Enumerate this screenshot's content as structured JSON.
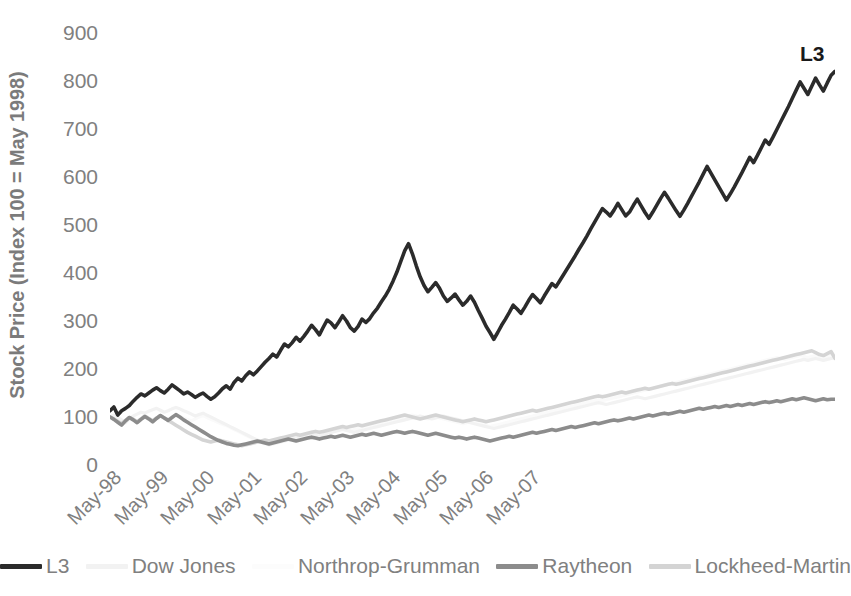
{
  "chart_data": {
    "type": "line",
    "title": "",
    "xlabel": "",
    "ylabel": "Stock Price (Index 100 = May 1998)",
    "ylim": [
      0,
      900
    ],
    "yticks": [
      900,
      800,
      700,
      600,
      500,
      400,
      300,
      200,
      100,
      0
    ],
    "grid": false,
    "legend_position": "bottom",
    "annotations": [
      {
        "text": "L3",
        "series": "L3",
        "position": "end-of-line-top-right"
      }
    ],
    "x_tick_labels": [
      "May-98",
      "May-99",
      "May-00",
      "May-01",
      "May-02",
      "May-03",
      "May-04",
      "May-05",
      "May-06",
      "May-07"
    ],
    "x_start": "May-98",
    "x_end": "Dec-07",
    "x_frequency": "monthly",
    "series": [
      {
        "name": "L3",
        "color": "#2b2b2b",
        "width": 3.6,
        "values": [
          113,
          121,
          104,
          113,
          118,
          124,
          133,
          141,
          148,
          144,
          150,
          156,
          161,
          155,
          150,
          158,
          167,
          161,
          155,
          148,
          152,
          147,
          141,
          146,
          150,
          143,
          137,
          142,
          150,
          159,
          165,
          158,
          172,
          181,
          175,
          186,
          194,
          188,
          196,
          205,
          214,
          222,
          231,
          225,
          239,
          252,
          246,
          255,
          266,
          258,
          268,
          279,
          291,
          282,
          271,
          287,
          302,
          296,
          286,
          298,
          311,
          300,
          286,
          279,
          289,
          304,
          297,
          305,
          317,
          327,
          340,
          352,
          366,
          383,
          402,
          424,
          446,
          461,
          440,
          415,
          392,
          374,
          361,
          370,
          380,
          368,
          352,
          341,
          348,
          356,
          344,
          333,
          341,
          352,
          339,
          322,
          306,
          289,
          276,
          262,
          276,
          291,
          304,
          318,
          333,
          325,
          316,
          329,
          343,
          355,
          347,
          338,
          352,
          365,
          378,
          371,
          384,
          397,
          410,
          423,
          436,
          450,
          463,
          477,
          492,
          506,
          520,
          534,
          527,
          519,
          531,
          545,
          532,
          519,
          527,
          541,
          554,
          540,
          526,
          514,
          527,
          541,
          555,
          568,
          556,
          543,
          530,
          518,
          531,
          545,
          560,
          575,
          590,
          606,
          622,
          608,
          594,
          580,
          566,
          552,
          565,
          579,
          594,
          609,
          625,
          641,
          630,
          645,
          661,
          677,
          668,
          683,
          699,
          715,
          731,
          747,
          764,
          781,
          798,
          785,
          772,
          789,
          806,
          792,
          779,
          796,
          812,
          820
        ]
      },
      {
        "name": "Dow Jones",
        "color": "#f2f2f2",
        "width": 3.2,
        "values": [
          100,
          104,
          99,
          94,
          88,
          96,
          102,
          106,
          110,
          108,
          112,
          115,
          118,
          114,
          110,
          113,
          117,
          120,
          117,
          113,
          110,
          106,
          102,
          105,
          108,
          104,
          100,
          96,
          92,
          88,
          84,
          80,
          76,
          72,
          68,
          64,
          60,
          56,
          52,
          48,
          45,
          42,
          44,
          46,
          48,
          50,
          52,
          54,
          56,
          58,
          60,
          62,
          64,
          62,
          60,
          63,
          66,
          68,
          70,
          72,
          74,
          72,
          70,
          68,
          70,
          72,
          74,
          76,
          78,
          80,
          82,
          84,
          86,
          88,
          90,
          92,
          94,
          96,
          98,
          100,
          102,
          100,
          98,
          96,
          98,
          100,
          102,
          100,
          98,
          96,
          94,
          92,
          90,
          88,
          86,
          84,
          82,
          80,
          78,
          76,
          78,
          80,
          82,
          84,
          86,
          88,
          90,
          92,
          94,
          96,
          98,
          100,
          102,
          104,
          106,
          108,
          110,
          112,
          114,
          116,
          118,
          120,
          122,
          124,
          126,
          128,
          130,
          128,
          126,
          128,
          130,
          132,
          134,
          136,
          138,
          140,
          142,
          140,
          138,
          140,
          142,
          144,
          146,
          148,
          150,
          152,
          154,
          156,
          158,
          160,
          162,
          164,
          166,
          168,
          170,
          172,
          174,
          176,
          178,
          180,
          182,
          184,
          186,
          188,
          190,
          192,
          194,
          196,
          198,
          200,
          202,
          204,
          206,
          208,
          210,
          212,
          214,
          216,
          218,
          220,
          218,
          220,
          222,
          220,
          218,
          220,
          222,
          224
        ]
      },
      {
        "name": "Northrop-Grumman",
        "color": "#fafafa",
        "width": 3.2,
        "values": [
          100,
          97,
          93,
          90,
          94,
          98,
          95,
          92,
          96,
          100,
          97,
          94,
          98,
          102,
          99,
          96,
          100,
          104,
          101,
          98,
          95,
          92,
          96,
          100,
          103,
          99,
          95,
          92,
          88,
          85,
          82,
          78,
          74,
          70,
          66,
          62,
          58,
          54,
          50,
          46,
          44,
          42,
          44,
          46,
          48,
          50,
          52,
          54,
          56,
          58,
          60,
          58,
          60,
          62,
          64,
          66,
          68,
          70,
          72,
          74,
          76,
          74,
          72,
          74,
          76,
          78,
          80,
          82,
          84,
          86,
          88,
          90,
          92,
          94,
          96,
          98,
          100,
          102,
          104,
          102,
          100,
          98,
          96,
          98,
          100,
          98,
          96,
          94,
          92,
          90,
          88,
          86,
          88,
          90,
          88,
          86,
          84,
          82,
          80,
          82,
          84,
          86,
          88,
          90,
          92,
          94,
          96,
          98,
          100,
          102,
          104,
          106,
          108,
          110,
          112,
          114,
          116,
          118,
          120,
          122,
          124,
          126,
          128,
          130,
          132,
          134,
          136,
          134,
          136,
          138,
          140,
          142,
          144,
          146,
          148,
          150,
          152,
          154,
          156,
          158,
          160,
          162,
          164,
          166,
          168,
          170,
          172,
          174,
          176,
          178,
          180,
          182,
          184,
          186,
          188,
          190,
          192,
          194,
          196,
          198,
          200,
          202,
          204,
          206,
          208,
          210,
          212,
          214,
          216,
          218,
          220,
          222,
          224,
          222,
          220,
          222,
          224,
          226,
          228,
          226,
          224,
          226,
          228,
          226,
          224,
          226,
          228,
          226
        ]
      },
      {
        "name": "Raytheon",
        "color": "#8c8c8c",
        "width": 3.6,
        "values": [
          100,
          95,
          89,
          83,
          92,
          99,
          94,
          88,
          95,
          101,
          96,
          90,
          97,
          103,
          98,
          93,
          99,
          105,
          100,
          94,
          89,
          84,
          79,
          74,
          69,
          64,
          59,
          55,
          51,
          48,
          45,
          43,
          41,
          40,
          42,
          44,
          46,
          48,
          50,
          48,
          46,
          44,
          46,
          48,
          50,
          52,
          54,
          52,
          50,
          52,
          54,
          56,
          58,
          56,
          54,
          56,
          58,
          60,
          58,
          60,
          62,
          60,
          58,
          60,
          62,
          64,
          62,
          64,
          66,
          64,
          62,
          64,
          66,
          68,
          70,
          68,
          66,
          68,
          70,
          68,
          66,
          64,
          62,
          64,
          66,
          64,
          62,
          60,
          58,
          56,
          58,
          56,
          54,
          56,
          58,
          56,
          54,
          52,
          50,
          52,
          54,
          56,
          58,
          60,
          58,
          60,
          62,
          64,
          66,
          68,
          66,
          68,
          70,
          72,
          74,
          72,
          74,
          76,
          78,
          80,
          78,
          80,
          82,
          84,
          86,
          88,
          86,
          88,
          90,
          92,
          94,
          92,
          94,
          96,
          98,
          96,
          98,
          100,
          102,
          104,
          102,
          104,
          106,
          108,
          106,
          108,
          110,
          112,
          110,
          112,
          114,
          116,
          118,
          116,
          118,
          120,
          122,
          120,
          122,
          124,
          122,
          124,
          126,
          124,
          126,
          128,
          126,
          128,
          130,
          132,
          130,
          132,
          134,
          132,
          134,
          136,
          138,
          136,
          138,
          140,
          138,
          136,
          134,
          136,
          138,
          136,
          137,
          137
        ]
      },
      {
        "name": "Lockheed-Martin",
        "color": "#d4d4d4",
        "width": 3.6,
        "values": [
          100,
          96,
          91,
          86,
          93,
          99,
          95,
          90,
          96,
          102,
          97,
          92,
          98,
          103,
          98,
          93,
          88,
          83,
          78,
          73,
          68,
          64,
          60,
          56,
          52,
          50,
          48,
          50,
          52,
          50,
          48,
          46,
          44,
          42,
          40,
          42,
          44,
          46,
          48,
          50,
          52,
          50,
          52,
          54,
          56,
          58,
          60,
          62,
          64,
          62,
          64,
          66,
          68,
          70,
          68,
          70,
          72,
          74,
          76,
          78,
          80,
          78,
          80,
          82,
          84,
          82,
          84,
          86,
          88,
          90,
          92,
          94,
          96,
          98,
          100,
          102,
          104,
          102,
          100,
          98,
          96,
          98,
          100,
          102,
          104,
          102,
          100,
          98,
          96,
          94,
          92,
          90,
          92,
          94,
          96,
          94,
          92,
          90,
          92,
          94,
          96,
          98,
          100,
          102,
          104,
          106,
          108,
          110,
          112,
          114,
          112,
          114,
          116,
          118,
          120,
          122,
          124,
          126,
          128,
          130,
          132,
          134,
          136,
          138,
          140,
          142,
          144,
          142,
          144,
          146,
          148,
          150,
          152,
          150,
          152,
          154,
          156,
          158,
          160,
          158,
          160,
          162,
          164,
          166,
          168,
          170,
          168,
          170,
          172,
          174,
          176,
          178,
          180,
          182,
          184,
          186,
          188,
          190,
          192,
          194,
          196,
          198,
          200,
          202,
          204,
          206,
          208,
          210,
          212,
          214,
          216,
          218,
          220,
          222,
          224,
          226,
          228,
          230,
          232,
          234,
          236,
          238,
          234,
          230,
          228,
          232,
          236,
          222
        ]
      }
    ]
  },
  "legend": {
    "items": [
      {
        "label": "L3",
        "color": "#2b2b2b"
      },
      {
        "label": "Dow Jones",
        "color": "#f2f2f2"
      },
      {
        "label": "Northrop-Grumman",
        "color": "#fcfcfc"
      },
      {
        "label": "Raytheon",
        "color": "#8c8c8c"
      },
      {
        "label": "Lockheed-Martin",
        "color": "#d4d4d4"
      }
    ]
  },
  "annotation": {
    "l3_label": "L3"
  },
  "axis": {
    "y_title": "Stock Price (Index 100 = May 1998)",
    "y_ticks": [
      "900",
      "800",
      "700",
      "600",
      "500",
      "400",
      "300",
      "200",
      "100",
      "0"
    ],
    "x_ticks": [
      "May-98",
      "May-99",
      "May-00",
      "May-01",
      "May-02",
      "May-03",
      "May-04",
      "May-05",
      "May-06",
      "May-07"
    ]
  },
  "colors": {
    "text": "#808080",
    "l3": "#2b2b2b",
    "raytheon": "#8c8c8c",
    "lockheed": "#d4d4d4",
    "dow": "#f2f2f2",
    "northrop": "#fcfcfc",
    "background": "#ffffff"
  }
}
